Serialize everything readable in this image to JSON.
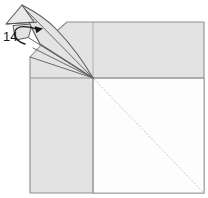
{
  "figure": {
    "step_label": "14"
  },
  "colors": {
    "background": "#ffffff",
    "paper_shaded": "#e3e3e3",
    "paper_highlight": "#e9e9e9",
    "paper_white": "#fdfdfd",
    "crease_line": "#8f8f8f",
    "flap_outline": "#5a5a5a",
    "diagonal_faint": "#c7c7c7",
    "arrow": "#161616",
    "label_text": "#1a1a1a"
  }
}
